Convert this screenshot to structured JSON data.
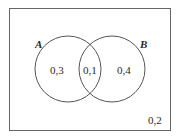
{
  "diagram": {
    "type": "venn",
    "universe_value": "0,2",
    "sets": [
      {
        "name": "A",
        "only_value": "0,3"
      },
      {
        "name": "B",
        "only_value": "0,4"
      }
    ],
    "intersection_value": "0,1"
  },
  "colors": {
    "stroke": "#555555",
    "text": "#2a2a2a",
    "background": "#ffffff"
  }
}
